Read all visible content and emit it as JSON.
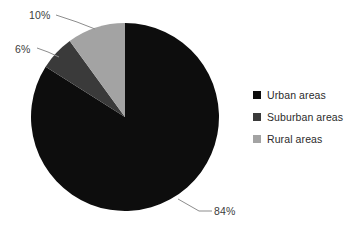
{
  "chart_data": {
    "type": "pie",
    "title": "",
    "categories": [
      "Urban areas",
      "Suburban areas",
      "Rural areas"
    ],
    "values": [
      84,
      6,
      10
    ],
    "value_labels": [
      "84%",
      "6%",
      "10%"
    ],
    "units": "percent",
    "colors": [
      "#0d0d0d",
      "#3a3a3a",
      "#a3a3a3"
    ],
    "start_angle_deg": 0,
    "direction": "counterclockwise",
    "legend_position": "right",
    "grid": false,
    "xlabel": "",
    "ylabel": ""
  },
  "legend": {
    "items": [
      {
        "label": "Urban areas",
        "color": "#0d0d0d"
      },
      {
        "label": "Suburban areas",
        "color": "#3a3a3a"
      },
      {
        "label": "Rural areas",
        "color": "#a3a3a3"
      }
    ]
  },
  "labels": {
    "urban": "84%",
    "suburban": "6%",
    "rural": "10%"
  },
  "geometry": {
    "center_x": 125,
    "center_y": 117,
    "radius": 94
  }
}
